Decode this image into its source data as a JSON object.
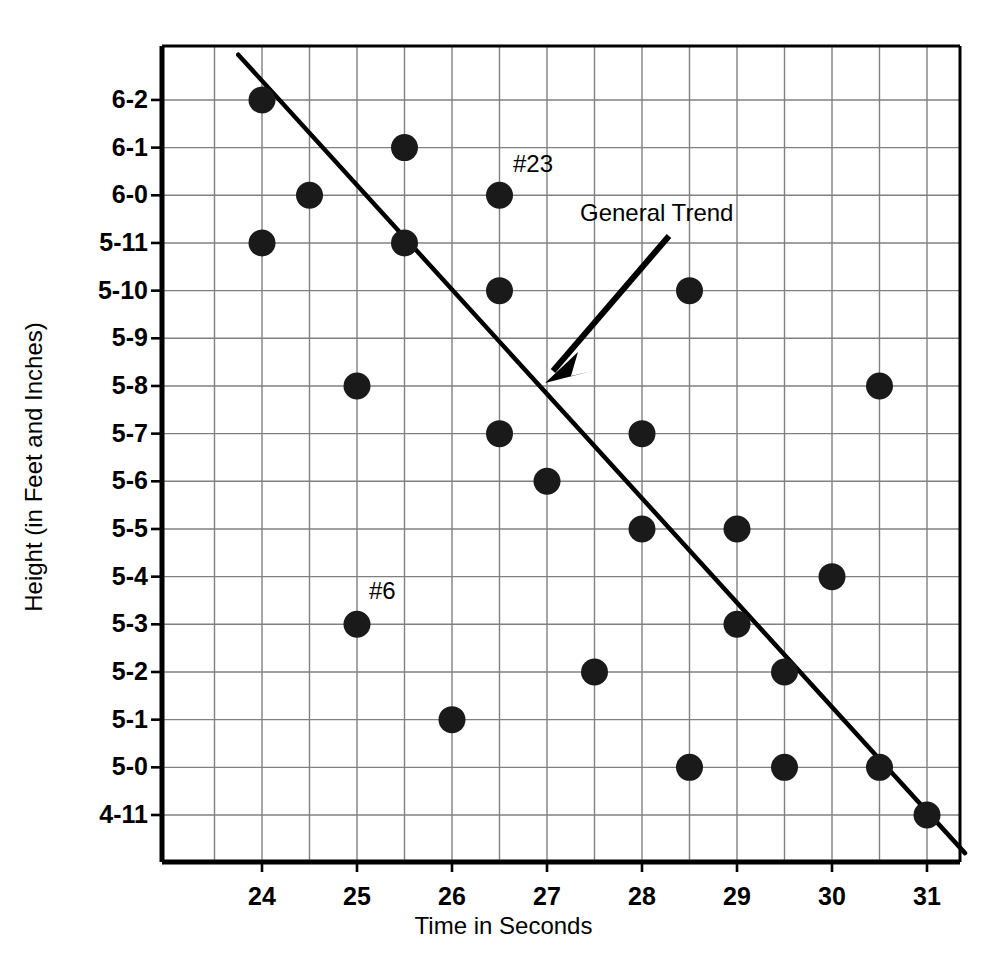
{
  "chart_data": {
    "type": "scatter",
    "title": "",
    "xlabel": "Time in Seconds",
    "ylabel": "Height (in Feet and Inches)",
    "xlim": [
      23.5,
      31.5
    ],
    "ylim": [
      -1,
      15
    ],
    "grid": true,
    "legend_position": "none",
    "x_ticks": [
      "24",
      "25",
      "26",
      "27",
      "28",
      "29",
      "30",
      "31"
    ],
    "x_tick_values": [
      24,
      25,
      26,
      27,
      28,
      29,
      30,
      31
    ],
    "y_ticks": [
      "6-2",
      "6-1",
      "6-0",
      "5-11",
      "5-10",
      "5-9",
      "5-8",
      "5-7",
      "5-6",
      "5-5",
      "5-4",
      "5-3",
      "5-2",
      "5-1",
      "5-0",
      "4-11"
    ],
    "y_tick_values": [
      15,
      14,
      13,
      12,
      11,
      10,
      9,
      8,
      7,
      6,
      5,
      4,
      3,
      2,
      1,
      0
    ],
    "points": [
      {
        "x": 24,
        "y": 15,
        "height": "6-2"
      },
      {
        "x": 24,
        "y": 12,
        "height": "5-11"
      },
      {
        "x": 24.5,
        "y": 13,
        "height": "6-0"
      },
      {
        "x": 25,
        "y": 9,
        "height": "5-8"
      },
      {
        "x": 25,
        "y": 4,
        "height": "5-3",
        "label": "#6"
      },
      {
        "x": 25.5,
        "y": 14,
        "height": "6-1"
      },
      {
        "x": 25.5,
        "y": 12,
        "height": "5-11"
      },
      {
        "x": 26,
        "y": 2,
        "height": "5-1"
      },
      {
        "x": 26.5,
        "y": 13,
        "height": "6-0",
        "label": "#23"
      },
      {
        "x": 26.5,
        "y": 11,
        "height": "5-10"
      },
      {
        "x": 26.5,
        "y": 8,
        "height": "5-7"
      },
      {
        "x": 27,
        "y": 7,
        "height": "5-6"
      },
      {
        "x": 27.5,
        "y": 3,
        "height": "5-2"
      },
      {
        "x": 28,
        "y": 8,
        "height": "5-7"
      },
      {
        "x": 28,
        "y": 6,
        "height": "5-5"
      },
      {
        "x": 28.5,
        "y": 11,
        "height": "5-10"
      },
      {
        "x": 28.5,
        "y": 1,
        "height": "5-0"
      },
      {
        "x": 29,
        "y": 6,
        "height": "5-5"
      },
      {
        "x": 29,
        "y": 4,
        "height": "5-3"
      },
      {
        "x": 29.5,
        "y": 3,
        "height": "5-2"
      },
      {
        "x": 29.5,
        "y": 1,
        "height": "5-0"
      },
      {
        "x": 30,
        "y": 5,
        "height": "5-4"
      },
      {
        "x": 30.5,
        "y": 9,
        "height": "5-8"
      },
      {
        "x": 30.5,
        "y": 1,
        "height": "5-0"
      },
      {
        "x": 31,
        "y": 0,
        "height": "4-11"
      }
    ],
    "trend_line": {
      "label": "General Trend",
      "x_start": 23.75,
      "y_start": 15.95,
      "x_end": 31.4,
      "y_end": -0.8
    },
    "annotations": [
      {
        "text": "#23",
        "x": 26.75,
        "y": 13.85
      },
      {
        "text": "#6",
        "x": 25.15,
        "y": 4.85
      },
      {
        "text": "General Trend",
        "x": 27.4,
        "y": 12.6
      }
    ],
    "marker_color": "#1a1a1a",
    "grid_color": "#808080",
    "axis_color": "#000000",
    "trend_color": "#000000"
  },
  "axes": {
    "x_title": "Time in Seconds",
    "y_title": "Height (in Feet and Inches)"
  },
  "labels": {
    "annotation_23": "#23",
    "annotation_6": "#6",
    "annotation_trend": "General Trend"
  }
}
